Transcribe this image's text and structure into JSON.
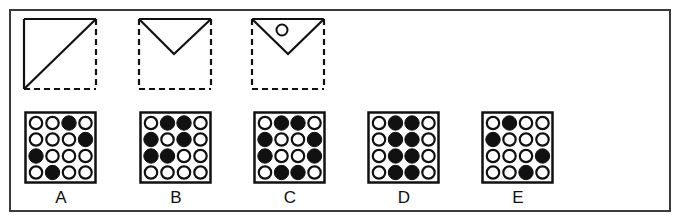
{
  "puzzle": {
    "sequence": [
      {
        "id": "fold-1",
        "description": "square with diagonal fold from bottom-left to top-right; solid top and left edges, dashed right and bottom edges",
        "x": 24,
        "hole": false
      },
      {
        "id": "fold-2",
        "description": "top edge solid with V-shaped fold meeting at center; dashed left, right and bottom edges",
        "x": 139,
        "hole": false
      },
      {
        "id": "fold-3",
        "description": "V-shaped folded triangle with a hole punched near top-left",
        "x": 252,
        "hole": true
      }
    ],
    "options": [
      {
        "label": "A",
        "x": 24,
        "grid": [
          [
            0,
            0,
            1,
            0
          ],
          [
            0,
            0,
            0,
            1
          ],
          [
            1,
            0,
            0,
            0
          ],
          [
            0,
            1,
            0,
            0
          ]
        ]
      },
      {
        "label": "B",
        "x": 139,
        "grid": [
          [
            0,
            1,
            1,
            0
          ],
          [
            1,
            0,
            1,
            0
          ],
          [
            1,
            1,
            0,
            0
          ],
          [
            0,
            0,
            0,
            0
          ]
        ]
      },
      {
        "label": "C",
        "x": 253,
        "grid": [
          [
            0,
            1,
            1,
            0
          ],
          [
            1,
            0,
            0,
            1
          ],
          [
            1,
            0,
            0,
            1
          ],
          [
            0,
            1,
            1,
            0
          ]
        ]
      },
      {
        "label": "D",
        "x": 367,
        "grid": [
          [
            0,
            1,
            1,
            0
          ],
          [
            0,
            1,
            1,
            0
          ],
          [
            0,
            1,
            1,
            0
          ],
          [
            0,
            1,
            1,
            0
          ]
        ]
      },
      {
        "label": "E",
        "x": 481,
        "grid": [
          [
            0,
            1,
            0,
            0
          ],
          [
            1,
            0,
            0,
            0
          ],
          [
            0,
            0,
            0,
            1
          ],
          [
            0,
            0,
            1,
            0
          ]
        ]
      }
    ]
  },
  "colors": {
    "ink": "#111111",
    "frame": "#3a3a3a",
    "background": "#ffffff"
  }
}
